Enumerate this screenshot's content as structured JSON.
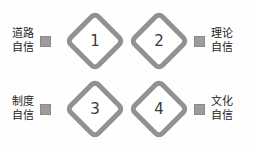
{
  "figure": {
    "title": "",
    "background_color": "#fefefe",
    "diamond_stroke_color": "#919191",
    "diamond_fill_color": "#ffffff",
    "marker_color": "#9c9c9c",
    "number_color": "#3a3a3a",
    "label_color": "#232323",
    "nodes": [
      {
        "number": "1",
        "position": "top-left"
      },
      {
        "number": "2",
        "position": "top-right"
      },
      {
        "number": "3",
        "position": "bottom-left"
      },
      {
        "number": "4",
        "position": "bottom-right"
      }
    ],
    "labels": {
      "top_left": {
        "line1": "道路",
        "line2": "自信",
        "marker": "square-marker"
      },
      "bottom_left": {
        "line1": "制度",
        "line2": "自信",
        "marker": "square-marker"
      },
      "top_right": {
        "line1": "理论",
        "line2": "自信",
        "marker": "square-marker"
      },
      "bottom_right": {
        "line1": "文化",
        "line2": "自信",
        "marker": "square-marker"
      }
    }
  }
}
